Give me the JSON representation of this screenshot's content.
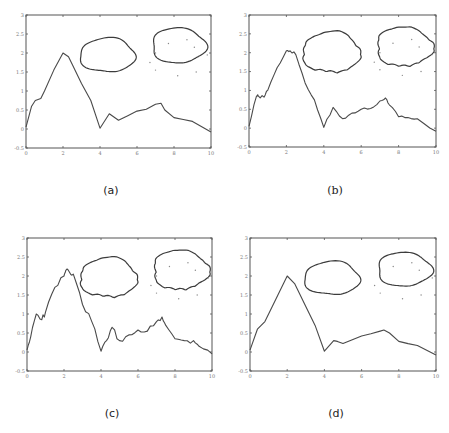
{
  "figure": {
    "captions": [
      "(a)",
      "(b)",
      "(c)",
      "(d)"
    ]
  },
  "chart_data": [
    {
      "type": "line",
      "panel": "(a)",
      "title": "",
      "xlabel": "",
      "ylabel": "",
      "xlim": [
        0,
        10
      ],
      "ylim": [
        -0.5,
        3
      ],
      "xticks": [
        0,
        2,
        4,
        6,
        8,
        10
      ],
      "yticks": [
        -0.5,
        0,
        0.5,
        1,
        1.5,
        2,
        2.5,
        3
      ],
      "ytick_labels": [
        "-0.5",
        "0",
        "0.5",
        "1",
        "1.5",
        "2",
        "2.5",
        "3"
      ],
      "grid": false,
      "noise": 0,
      "series": [
        {
          "name": "curve",
          "x": [
            0,
            0.3,
            0.5,
            0.8,
            1,
            1.5,
            2,
            2.3,
            2.5,
            3,
            3.5,
            4,
            4.5,
            5,
            5.5,
            6,
            6.5,
            7,
            7.3,
            7.5,
            8,
            8.5,
            9,
            10
          ],
          "y": [
            0.05,
            0.6,
            0.75,
            0.8,
            1.0,
            1.55,
            2.0,
            1.9,
            1.7,
            1.2,
            0.75,
            0.02,
            0.4,
            0.23,
            0.35,
            0.47,
            0.52,
            0.65,
            0.68,
            0.5,
            0.3,
            0.25,
            0.2,
            -0.08
          ]
        }
      ],
      "blobs": [
        {
          "cx": 4.4,
          "cy": 1.9,
          "rx": 1.5,
          "ry": 0.48,
          "jagged": false
        },
        {
          "cx": 8.25,
          "cy": 2.15,
          "rx": 1.45,
          "ry": 0.5,
          "jagged": false
        }
      ],
      "scatter": {
        "x": [
          7,
          7.7,
          8.7,
          9.1,
          7,
          8.2,
          9.2,
          6.7,
          9.8
        ],
        "y": [
          2,
          2.25,
          2.35,
          2.15,
          1.55,
          1.4,
          1.5,
          1.75,
          1.95
        ]
      }
    },
    {
      "type": "line",
      "panel": "(b)",
      "title": "",
      "xlabel": "",
      "ylabel": "",
      "xlim": [
        0,
        10
      ],
      "ylim": [
        -0.5,
        3
      ],
      "xticks": [
        0,
        2,
        4,
        6,
        8,
        10
      ],
      "yticks": [
        -0.5,
        0,
        0.5,
        1,
        1.5,
        2,
        2.5,
        3
      ],
      "ytick_labels": [
        "-0.5",
        "0",
        "0.5",
        "1",
        "1.5",
        "2",
        "2.5",
        "3"
      ],
      "grid": false,
      "noise": 0.04,
      "series": [
        {
          "name": "curve",
          "x": [
            0,
            0.4,
            0.5,
            0.8,
            1,
            1.5,
            2,
            2.2,
            2.5,
            3,
            3.5,
            4,
            4.5,
            5,
            5.5,
            6,
            6.5,
            7,
            7.3,
            7.5,
            8,
            8.5,
            9,
            10
          ],
          "y": [
            0.05,
            0.85,
            0.85,
            0.82,
            1.0,
            1.6,
            2.05,
            2.05,
            1.95,
            1.2,
            0.75,
            0.02,
            0.55,
            0.25,
            0.4,
            0.5,
            0.52,
            0.72,
            0.8,
            0.62,
            0.3,
            0.28,
            0.25,
            -0.08
          ]
        }
      ],
      "blobs": [
        {
          "cx": 4.4,
          "cy": 1.95,
          "rx": 1.5,
          "ry": 0.6,
          "jagged": true
        },
        {
          "cx": 8.3,
          "cy": 2.1,
          "rx": 1.45,
          "ry": 0.58,
          "jagged": true
        }
      ],
      "scatter": {
        "x": [
          7,
          7.7,
          8.7,
          9.1,
          7,
          8.2,
          9.2,
          6.7,
          9.8
        ],
        "y": [
          2,
          2.25,
          2.35,
          2.15,
          1.55,
          1.4,
          1.5,
          1.75,
          1.95
        ]
      }
    },
    {
      "type": "line",
      "panel": "(c)",
      "title": "",
      "xlabel": "",
      "ylabel": "",
      "xlim": [
        0,
        10
      ],
      "ylim": [
        -0.5,
        3
      ],
      "xticks": [
        0,
        2,
        4,
        6,
        8,
        10
      ],
      "yticks": [
        -0.5,
        0,
        0.5,
        1,
        1.5,
        2,
        2.5,
        3
      ],
      "ytick_labels": [
        "-0.5",
        "0",
        "0.5",
        "1",
        "1.5",
        "2",
        "2.5",
        "3"
      ],
      "grid": false,
      "noise": 0.07,
      "series": [
        {
          "name": "curve",
          "x": [
            0,
            0.2,
            0.5,
            0.8,
            1,
            1.5,
            2,
            2.1,
            2.3,
            2.5,
            3,
            3.5,
            4,
            4.3,
            4.6,
            5,
            5.5,
            6,
            6.5,
            7,
            7.3,
            7.5,
            8,
            8.5,
            9,
            9.3,
            10
          ],
          "y": [
            0.05,
            0.4,
            1.0,
            0.85,
            1.05,
            1.7,
            2.0,
            2.15,
            2.1,
            2.05,
            1.25,
            0.8,
            0.02,
            0.3,
            0.65,
            0.3,
            0.45,
            0.58,
            0.55,
            0.8,
            0.92,
            0.7,
            0.35,
            0.3,
            0.3,
            0.15,
            -0.05
          ]
        }
      ],
      "blobs": [
        {
          "cx": 4.4,
          "cy": 1.9,
          "rx": 1.5,
          "ry": 0.58,
          "jagged": true
        },
        {
          "cx": 8.3,
          "cy": 2.1,
          "rx": 1.45,
          "ry": 0.58,
          "jagged": true
        }
      ],
      "scatter": {
        "x": [
          7,
          7.7,
          8.7,
          9.1,
          7,
          8.2,
          9.2,
          6.7,
          9.8
        ],
        "y": [
          2,
          2.25,
          2.35,
          2.15,
          1.55,
          1.4,
          1.5,
          1.75,
          1.95
        ]
      }
    },
    {
      "type": "line",
      "panel": "(d)",
      "title": "",
      "xlabel": "",
      "ylabel": "",
      "xlim": [
        0,
        10
      ],
      "ylim": [
        -0.5,
        3
      ],
      "xticks": [
        0,
        2,
        4,
        6,
        8,
        10
      ],
      "yticks": [
        -0.5,
        0,
        0.5,
        1,
        1.5,
        2,
        2.5,
        3
      ],
      "ytick_labels": [
        "-0.5",
        "0",
        "0.5",
        "1",
        "1.5",
        "2",
        "2.5",
        "3"
      ],
      "grid": false,
      "noise": 0,
      "series": [
        {
          "name": "curve",
          "x": [
            0,
            0.4,
            0.8,
            1,
            1.5,
            2,
            2.4,
            3,
            3.5,
            4,
            4.5,
            4.7,
            5,
            5.5,
            6,
            6.5,
            7,
            7.2,
            7.5,
            8,
            8.5,
            9,
            10
          ],
          "y": [
            0.05,
            0.6,
            0.8,
            1.0,
            1.5,
            2.0,
            1.8,
            1.2,
            0.7,
            0.02,
            0.3,
            0.28,
            0.22,
            0.32,
            0.42,
            0.48,
            0.55,
            0.58,
            0.5,
            0.28,
            0.22,
            0.17,
            -0.08
          ]
        }
      ],
      "blobs": [
        {
          "cx": 4.4,
          "cy": 1.9,
          "rx": 1.5,
          "ry": 0.47,
          "jagged": false
        },
        {
          "cx": 8.3,
          "cy": 2.13,
          "rx": 1.45,
          "ry": 0.48,
          "jagged": false
        }
      ],
      "scatter": {
        "x": [
          7,
          7.7,
          8.7,
          9.1,
          7,
          8.2,
          9.2,
          6.7,
          9.8
        ],
        "y": [
          2,
          2.25,
          2.35,
          2.15,
          1.55,
          1.4,
          1.5,
          1.75,
          1.95
        ]
      }
    }
  ]
}
